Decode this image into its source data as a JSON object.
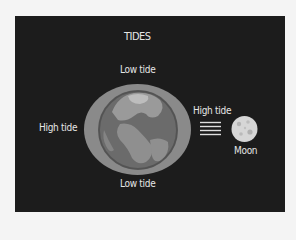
{
  "diagram": {
    "title": "TIDES",
    "labels": {
      "low_tide_top": "Low tide",
      "low_tide_bottom": "Low tide",
      "high_tide_left": "High tide",
      "high_tide_right": "High tide",
      "moon": "Moon"
    },
    "colors": {
      "background": "#1c1c1c",
      "ocean_bulge": "#8a8a8a",
      "earth_ocean": "#6e6e6e",
      "earth_land": "#9a9a9a",
      "moon": "#d8d8d8",
      "text": "#e6e6e6"
    },
    "elements": {
      "earth": "earth-icon",
      "tidal_bulge": "ocean-bulge-ellipse",
      "gravity_arrows": "gravity-lines-icon",
      "moon": "moon-icon"
    }
  }
}
